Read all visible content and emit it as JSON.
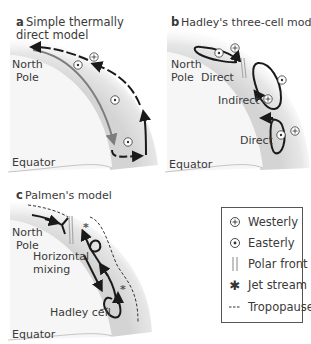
{
  "panels": {
    "a": {
      "letter": "a",
      "title_line1": "Simple thermally",
      "title_line2": "direct model",
      "north_pole": [
        "North",
        "Pole"
      ],
      "equator": "Equator"
    },
    "b": {
      "letter": "b",
      "title": "Hadley's three-cell model",
      "north_pole": [
        "North",
        "Pole"
      ],
      "equator": "Equator",
      "cells": [
        "Direct",
        "Indirect",
        "Direct"
      ]
    },
    "c": {
      "letter": "c",
      "title": "Palmen's model",
      "north_pole": [
        "North",
        "Pole"
      ],
      "equator": "Equator",
      "horizontal_mixing": [
        "Horizontal",
        "mixing"
      ],
      "hadley_cell": "Hadley cell"
    }
  },
  "legend": {
    "items": [
      {
        "symbol": "westerly-icon",
        "label": "Westerly"
      },
      {
        "symbol": "easterly-icon",
        "label": "Easterly"
      },
      {
        "symbol": "polar-front-icon",
        "label": "Polar front"
      },
      {
        "symbol": "jet-stream-icon",
        "label": "Jet stream"
      },
      {
        "symbol": "tropopause-icon",
        "label": "Tropopause"
      }
    ]
  },
  "colors": {
    "atmosphere_band": "#d9d9d9",
    "earth": "#f4f4f4",
    "arrow": "#1a1a1a",
    "grey_arrow": "#8a8a8a",
    "polar_front": "#b0b0b0"
  }
}
